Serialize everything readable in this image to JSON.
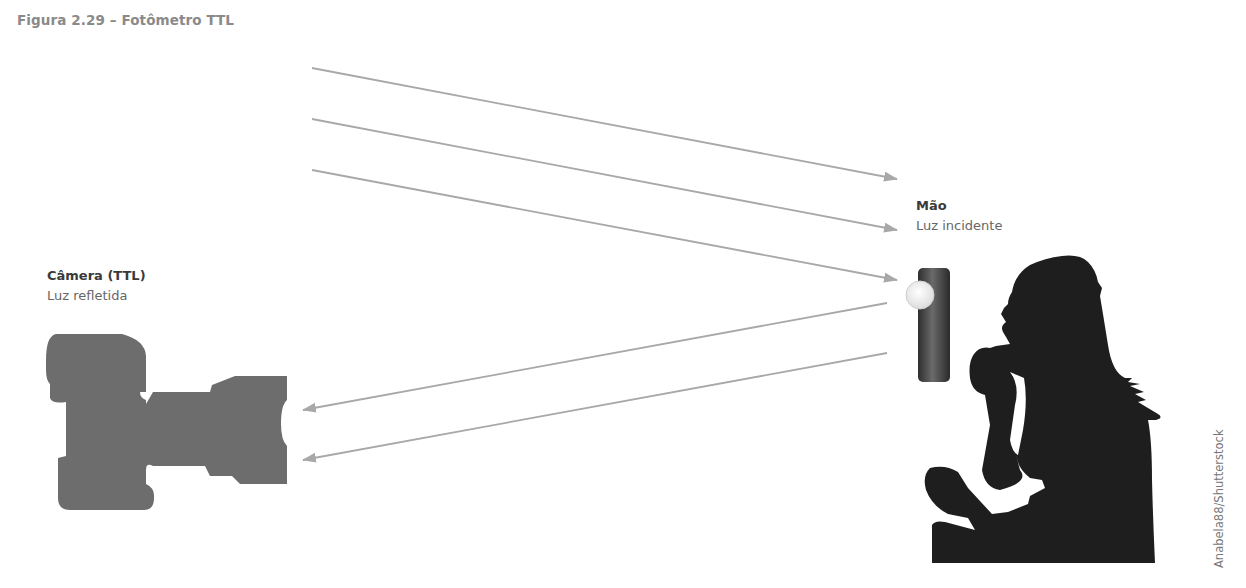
{
  "figure": {
    "caption": "Figura 2.29 – Fotômetro TTL"
  },
  "labels": {
    "hand": {
      "title": "Mão",
      "subtitle": "Luz incidente"
    },
    "camera": {
      "title": "Câmera (TTL)",
      "subtitle": "Luz refletida"
    }
  },
  "credit": "Anabela88/Shutterstock",
  "elements": {
    "camera_icon": "camera-silhouette-icon",
    "meter_icon": "light-meter-icon",
    "person_icon": "woman-silhouette-icon"
  },
  "colors": {
    "arrow": "#a8a8a8",
    "camera": "#6d6d6d",
    "silhouette": "#1e1e1e",
    "meter": "#444444",
    "caption": "#8a8a8a"
  },
  "arrows": {
    "incident": [
      {
        "from": [
          312,
          68
        ],
        "to": [
          897,
          179
        ]
      },
      {
        "from": [
          312,
          119
        ],
        "to": [
          897,
          230
        ]
      },
      {
        "from": [
          312,
          170
        ],
        "to": [
          897,
          280
        ]
      }
    ],
    "reflected": [
      {
        "from": [
          887,
          303
        ],
        "to": [
          303,
          410
        ]
      },
      {
        "from": [
          887,
          353
        ],
        "to": [
          303,
          460
        ]
      }
    ]
  }
}
